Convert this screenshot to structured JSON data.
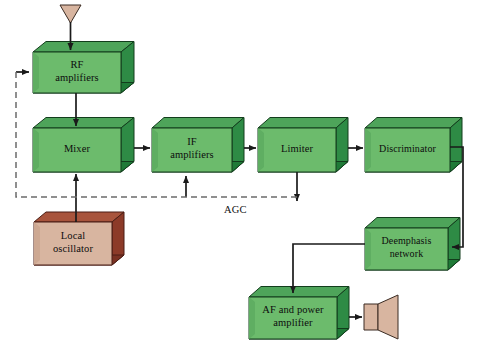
{
  "diagram": {
    "colors": {
      "block_face": "#6cbb6c",
      "block_face_light": "#7cc47c",
      "block_side": "#2e8b45",
      "block_bottom": "#1f7a37",
      "block_outline": "#123d1c",
      "osc_face": "#d8b5a0",
      "osc_side": "#8c3a28",
      "osc_bottom": "#7a3122",
      "osc_outline": "#4a1d14",
      "antenna_fill": "#d8b5a0",
      "speaker_fill": "#d8b5a0",
      "line": "#1a1a1a",
      "dashed_line": "#6b6b6b",
      "background": "#ffffff"
    },
    "blocks": [
      {
        "id": "rf_amplifiers",
        "label": "RF\namplifiers",
        "x": 33,
        "y": 52,
        "w": 88,
        "h": 41,
        "style": "green"
      },
      {
        "id": "mixer",
        "label": "Mixer",
        "x": 33,
        "y": 128,
        "w": 88,
        "h": 44,
        "style": "green"
      },
      {
        "id": "if_amplifiers",
        "label": "IF\namplifiers",
        "x": 152,
        "y": 128,
        "w": 80,
        "h": 44,
        "style": "green"
      },
      {
        "id": "limiter",
        "label": "Limiter",
        "x": 258,
        "y": 128,
        "w": 78,
        "h": 44,
        "style": "green"
      },
      {
        "id": "discriminator",
        "label": "Discriminator",
        "x": 365,
        "y": 128,
        "w": 85,
        "h": 44,
        "style": "green"
      },
      {
        "id": "local_oscillator",
        "label": "Local\noscillator",
        "x": 34,
        "y": 222,
        "w": 78,
        "h": 43,
        "style": "brown"
      },
      {
        "id": "deemphasis_network",
        "label": "Deemphasis\nnetwork",
        "x": 365,
        "y": 228,
        "w": 83,
        "h": 42,
        "style": "green"
      },
      {
        "id": "af_power_amplifier",
        "label": "AF and power\namplifier",
        "x": 249,
        "y": 297,
        "w": 88,
        "h": 42,
        "style": "green"
      }
    ],
    "annotations": [
      {
        "id": "agc_label",
        "text": "AGC",
        "x": 224,
        "y": 206
      }
    ],
    "symbols": [
      {
        "id": "antenna",
        "name": "antenna-symbol",
        "x": 60,
        "y": 5,
        "w": 21,
        "h": 18
      },
      {
        "id": "loudspeaker",
        "name": "loudspeaker-symbol",
        "x": 364,
        "y": 300,
        "w": 35,
        "h": 36
      }
    ],
    "connections": [
      {
        "from": "antenna",
        "to": "rf_amplifiers",
        "type": "solid"
      },
      {
        "from": "rf_amplifiers",
        "to": "mixer",
        "type": "solid"
      },
      {
        "from": "local_oscillator",
        "to": "mixer",
        "type": "solid"
      },
      {
        "from": "mixer",
        "to": "if_amplifiers",
        "type": "solid"
      },
      {
        "from": "if_amplifiers",
        "to": "limiter",
        "type": "solid"
      },
      {
        "from": "limiter",
        "to": "discriminator",
        "type": "solid"
      },
      {
        "from": "discriminator",
        "to": "deemphasis_network",
        "type": "solid"
      },
      {
        "from": "deemphasis_network",
        "to": "af_power_amplifier",
        "type": "solid"
      },
      {
        "from": "af_power_amplifier",
        "to": "loudspeaker",
        "type": "solid"
      },
      {
        "from": "limiter",
        "to": "agc_bus",
        "type": "solid",
        "label": "AGC"
      },
      {
        "from": "agc_bus",
        "to": "if_amplifiers",
        "type": "dashed",
        "label": "AGC"
      },
      {
        "from": "agc_bus",
        "to": "rf_amplifiers",
        "type": "dashed",
        "label": "AGC"
      }
    ]
  }
}
